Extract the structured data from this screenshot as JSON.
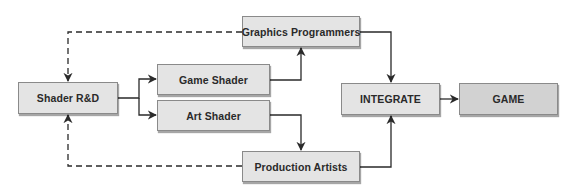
{
  "diagram": {
    "type": "flowchart",
    "colors": {
      "node_fill": "#e4e4e4",
      "node_fill_final": "#d2d2d2",
      "node_border": "#8a8a8a",
      "line": "#2a2a2a",
      "text": "#2a2a2a"
    },
    "nodes": {
      "shader_rd": {
        "label": "Shader R&D"
      },
      "game_shader": {
        "label": "Game Shader"
      },
      "art_shader": {
        "label": "Art Shader"
      },
      "graphics_programmers": {
        "label": "Graphics Programmers"
      },
      "production_artists": {
        "label": "Production Artists"
      },
      "integrate": {
        "label": "INTEGRATE"
      },
      "game": {
        "label": "GAME"
      }
    },
    "edges": [
      {
        "from": "Shader R&D",
        "to": "Game Shader",
        "style": "solid"
      },
      {
        "from": "Shader R&D",
        "to": "Art Shader",
        "style": "solid"
      },
      {
        "from": "Game Shader",
        "to": "Graphics Programmers",
        "style": "solid"
      },
      {
        "from": "Art Shader",
        "to": "Production Artists",
        "style": "solid"
      },
      {
        "from": "Graphics Programmers",
        "to": "INTEGRATE",
        "style": "solid"
      },
      {
        "from": "Production Artists",
        "to": "INTEGRATE",
        "style": "solid"
      },
      {
        "from": "INTEGRATE",
        "to": "GAME",
        "style": "solid"
      },
      {
        "from": "Graphics Programmers",
        "to": "Shader R&D",
        "style": "dashed"
      },
      {
        "from": "Production Artists",
        "to": "Shader R&D",
        "style": "dashed"
      }
    ]
  }
}
